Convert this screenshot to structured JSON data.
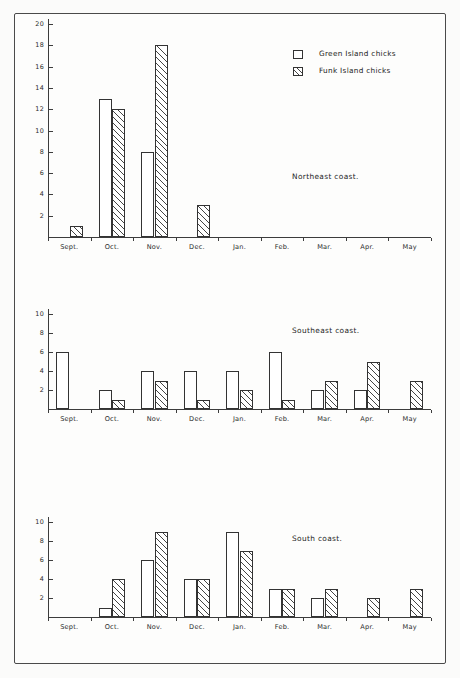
{
  "legend": {
    "position": "top-right",
    "entries": [
      {
        "label": "Green Island chicks",
        "swatch": "open-square-icon"
      },
      {
        "label": "Funk Island chicks",
        "swatch": "hatched-square-icon"
      }
    ]
  },
  "chart_data": [
    {
      "type": "bar",
      "title": "Northeast coast.",
      "xlabel": "",
      "ylabel": "",
      "ylim": [
        0,
        20
      ],
      "yticks": [
        2,
        4,
        6,
        8,
        10,
        12,
        14,
        16,
        18,
        20
      ],
      "grid": false,
      "categories": [
        "Sept.",
        "Oct.",
        "Nov.",
        "Dec.",
        "Jan.",
        "Feb.",
        "Mar.",
        "Apr.",
        "May"
      ],
      "series": [
        {
          "name": "Green Island chicks",
          "values": [
            0,
            13,
            8,
            0,
            0,
            0,
            0,
            0,
            0
          ]
        },
        {
          "name": "Funk Island chicks",
          "values": [
            1,
            12,
            18,
            3,
            0,
            0,
            0,
            0,
            0
          ]
        }
      ]
    },
    {
      "type": "bar",
      "title": "Southeast coast.",
      "xlabel": "",
      "ylabel": "",
      "ylim": [
        0,
        10
      ],
      "yticks": [
        2,
        4,
        6,
        8,
        10
      ],
      "grid": false,
      "categories": [
        "Sept.",
        "Oct.",
        "Nov.",
        "Dec.",
        "Jan.",
        "Feb.",
        "Mar.",
        "Apr.",
        "May"
      ],
      "series": [
        {
          "name": "Green Island chicks",
          "values": [
            6,
            2,
            4,
            4,
            4,
            6,
            2,
            2,
            0
          ]
        },
        {
          "name": "Funk Island chicks",
          "values": [
            0,
            1,
            3,
            1,
            2,
            1,
            3,
            5,
            3
          ]
        }
      ]
    },
    {
      "type": "bar",
      "title": "South coast.",
      "xlabel": "",
      "ylabel": "",
      "ylim": [
        0,
        10
      ],
      "yticks": [
        2,
        4,
        6,
        8,
        10
      ],
      "grid": false,
      "categories": [
        "Sept.",
        "Oct.",
        "Nov.",
        "Dec.",
        "Jan.",
        "Feb.",
        "Mar.",
        "Apr.",
        "May"
      ],
      "series": [
        {
          "name": "Green Island chicks",
          "values": [
            0,
            1,
            6,
            4,
            9,
            3,
            2,
            0,
            0
          ]
        },
        {
          "name": "Funk Island chicks",
          "values": [
            0,
            4,
            9,
            4,
            7,
            3,
            3,
            2,
            3
          ]
        }
      ]
    }
  ],
  "colors": {
    "ink": "#333333",
    "frame": "#4a4a4a",
    "background": "#fdfdfc"
  }
}
